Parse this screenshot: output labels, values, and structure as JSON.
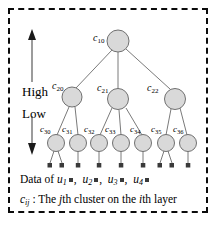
{
  "figure": {
    "border_style": "dashed",
    "border_color": "#0b0b0b",
    "background": "#ffffff",
    "node_fill": "#d9d9d9",
    "node_stroke": "#6e6e6e",
    "edge_color": "#6e6e6e",
    "dot_color": "#3a3a3a"
  },
  "axis": {
    "high_label": "High",
    "low_label": "Low",
    "up_arrow_name": "up-arrow",
    "down_arrow_name": "down-arrow"
  },
  "tree": {
    "layers": [
      {
        "layer": 1,
        "nodes": [
          {
            "id": "c10",
            "label": "c",
            "sub": "10",
            "cx": 118,
            "cy": 41,
            "r": 11
          }
        ]
      },
      {
        "layer": 2,
        "nodes": [
          {
            "id": "c20",
            "label": "c",
            "sub": "20",
            "cx": 72,
            "cy": 97,
            "r": 10
          },
          {
            "id": "c21",
            "label": "c",
            "sub": "21",
            "cx": 118,
            "cy": 99,
            "r": 10.5
          },
          {
            "id": "c22",
            "label": "c",
            "sub": "22",
            "cx": 175,
            "cy": 99,
            "r": 10.5
          }
        ]
      },
      {
        "layer": 3,
        "nodes": [
          {
            "id": "c30",
            "label": "c",
            "sub": "30",
            "cx": 56,
            "cy": 143,
            "r": 8.5
          },
          {
            "id": "c31",
            "label": "c",
            "sub": "31",
            "cx": 78,
            "cy": 143,
            "r": 8.5
          },
          {
            "id": "c32",
            "label": "c",
            "sub": "32",
            "cx": 99,
            "cy": 143,
            "r": 8.5
          },
          {
            "id": "c33",
            "label": "c",
            "sub": "33",
            "cx": 121,
            "cy": 143,
            "r": 8.5
          },
          {
            "id": "c34",
            "label": "c",
            "sub": "34",
            "cx": 143,
            "cy": 143,
            "r": 8.5
          },
          {
            "id": "c35",
            "label": "c",
            "sub": "35",
            "cx": 166,
            "cy": 143,
            "r": 8.5
          },
          {
            "id": "c36",
            "label": "c",
            "sub": "36",
            "cx": 188,
            "cy": 143,
            "r": 8.5
          }
        ]
      }
    ],
    "edges": [
      {
        "from": "c10",
        "to": "c20"
      },
      {
        "from": "c10",
        "to": "c21"
      },
      {
        "from": "c10",
        "to": "c22"
      },
      {
        "from": "c20",
        "to": "c30"
      },
      {
        "from": "c20",
        "to": "c31"
      },
      {
        "from": "c21",
        "to": "c32"
      },
      {
        "from": "c21",
        "to": "c33"
      },
      {
        "from": "c21",
        "to": "c34"
      },
      {
        "from": "c22",
        "to": "c35"
      },
      {
        "from": "c22",
        "to": "c36"
      }
    ],
    "leaf_stems": [
      {
        "parent": "c30",
        "x": 50,
        "y": 166
      },
      {
        "parent": "c30",
        "x": 62,
        "y": 166
      },
      {
        "parent": "c31",
        "x": 78,
        "y": 166
      },
      {
        "parent": "c32",
        "x": 99,
        "y": 166
      },
      {
        "parent": "c33",
        "x": 121,
        "y": 166
      },
      {
        "parent": "c34",
        "x": 143,
        "y": 166
      },
      {
        "parent": "c35",
        "x": 160,
        "y": 166
      },
      {
        "parent": "c35",
        "x": 172,
        "y": 166
      },
      {
        "parent": "c36",
        "x": 188,
        "y": 166
      }
    ]
  },
  "caption": {
    "data_prefix": "Data of ",
    "users": [
      {
        "symbol": "u",
        "sub": "1"
      },
      {
        "symbol": "u",
        "sub": "2"
      },
      {
        "symbol": "u",
        "sub": "3"
      },
      {
        "symbol": "u",
        "sub": "4"
      }
    ],
    "separator": ",",
    "legend_symbol": "c",
    "legend_sub": "ij",
    "legend_text_1": " : The ",
    "legend_italic_1": "j",
    "legend_text_2": "th cluster on the ",
    "legend_italic_2": "i",
    "legend_text_3": "th layer"
  }
}
